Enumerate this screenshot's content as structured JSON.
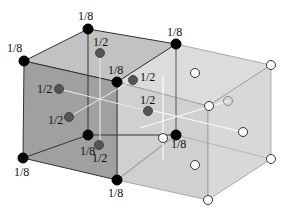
{
  "diagram": {
    "colors": {
      "left_cell_fill": "#9a9a9a",
      "left_top_fill": "#c4c4c4",
      "right_cell_fill": "#d6d6d6",
      "edge": "#333333",
      "corner_atom": "#000000",
      "face_atom": "#555555",
      "open_atom": "#ffffff"
    },
    "labels": {
      "corner": "1/8",
      "face": "1/2"
    },
    "corner_atoms": [
      {
        "x": 24,
        "y": 61,
        "label": "1/8",
        "lx": 7,
        "ly": 52
      },
      {
        "x": 88,
        "y": 29,
        "label": "1/8",
        "lx": 78,
        "ly": 20
      },
      {
        "x": 176,
        "y": 44,
        "label": "1/8",
        "lx": 167,
        "ly": 36
      },
      {
        "x": 117,
        "y": 82,
        "label": "1/8",
        "lx": 108,
        "ly": 74
      },
      {
        "x": 23,
        "y": 158,
        "label": "1/8",
        "lx": 14,
        "ly": 176
      },
      {
        "x": 88,
        "y": 135,
        "label": "1/8",
        "lx": 80,
        "ly": 155
      },
      {
        "x": 117,
        "y": 180,
        "label": "1/8",
        "lx": 108,
        "ly": 197
      },
      {
        "x": 176,
        "y": 135,
        "label": "1/8",
        "lx": 171,
        "ly": 148
      }
    ],
    "face_atoms": [
      {
        "x": 100,
        "y": 53,
        "label": "1/2",
        "lx": 93,
        "ly": 46
      },
      {
        "x": 59,
        "y": 89,
        "label": "1/2",
        "lx": 37,
        "ly": 93
      },
      {
        "x": 133,
        "y": 80,
        "label": "1/2",
        "lx": 140,
        "ly": 81
      },
      {
        "x": 148,
        "y": 111,
        "label": "1/2",
        "lx": 140,
        "ly": 104
      },
      {
        "x": 69,
        "y": 117,
        "label": "1/2",
        "lx": 48,
        "ly": 124
      },
      {
        "x": 99,
        "y": 145,
        "label": "1/2",
        "lx": 92,
        "ly": 162
      }
    ],
    "open_atoms": [
      {
        "x": 271,
        "y": 65
      },
      {
        "x": 195,
        "y": 73
      },
      {
        "x": 209,
        "y": 106
      },
      {
        "x": 163,
        "y": 138
      },
      {
        "x": 243,
        "y": 132
      },
      {
        "x": 195,
        "y": 165
      },
      {
        "x": 271,
        "y": 159
      },
      {
        "x": 208,
        "y": 200
      }
    ],
    "ghost_atoms": [
      {
        "x": 228,
        "y": 101
      }
    ]
  }
}
